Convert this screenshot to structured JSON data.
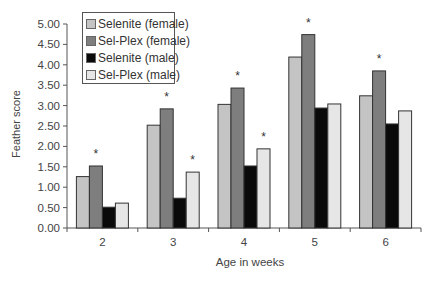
{
  "chart_data": {
    "type": "bar",
    "title": "",
    "xlabel": "Age in weeks",
    "ylabel": "Feather score",
    "categories": [
      "2",
      "3",
      "4",
      "5",
      "6"
    ],
    "ylim": [
      0,
      5
    ],
    "yticks": [
      "0.00",
      "0.50",
      "1.00",
      "1.50",
      "2.00",
      "2.50",
      "3.00",
      "3.50",
      "4.00",
      "4.50",
      "5.00"
    ],
    "grid": false,
    "legend_position": "upper-left-inside",
    "series": [
      {
        "name": "Selenite (female)",
        "color": "#c4c4c4",
        "values": [
          1.26,
          2.52,
          3.03,
          4.19,
          3.24
        ]
      },
      {
        "name": "Sel-Plex (female)",
        "color": "#7e7e7e",
        "values": [
          1.52,
          2.92,
          3.43,
          4.74,
          3.85
        ]
      },
      {
        "name": "Selenite (male)",
        "color": "#0a0a0a",
        "values": [
          0.51,
          0.73,
          1.52,
          2.94,
          2.55
        ]
      },
      {
        "name": "Sel-Plex (male)",
        "color": "#e6e6e6",
        "values": [
          0.61,
          1.37,
          1.94,
          3.04,
          2.87
        ]
      }
    ],
    "annotations": [
      {
        "text": "*",
        "category": "2",
        "series": "Sel-Plex (female)"
      },
      {
        "text": "*",
        "category": "3",
        "series": "Sel-Plex (female)"
      },
      {
        "text": "*",
        "category": "3",
        "series": "Sel-Plex (male)"
      },
      {
        "text": "*",
        "category": "4",
        "series": "Sel-Plex (female)"
      },
      {
        "text": "*",
        "category": "4",
        "series": "Sel-Plex (male)"
      },
      {
        "text": "*",
        "category": "5",
        "series": "Sel-Plex (female)"
      },
      {
        "text": "*",
        "category": "6",
        "series": "Sel-Plex (female)"
      }
    ]
  }
}
